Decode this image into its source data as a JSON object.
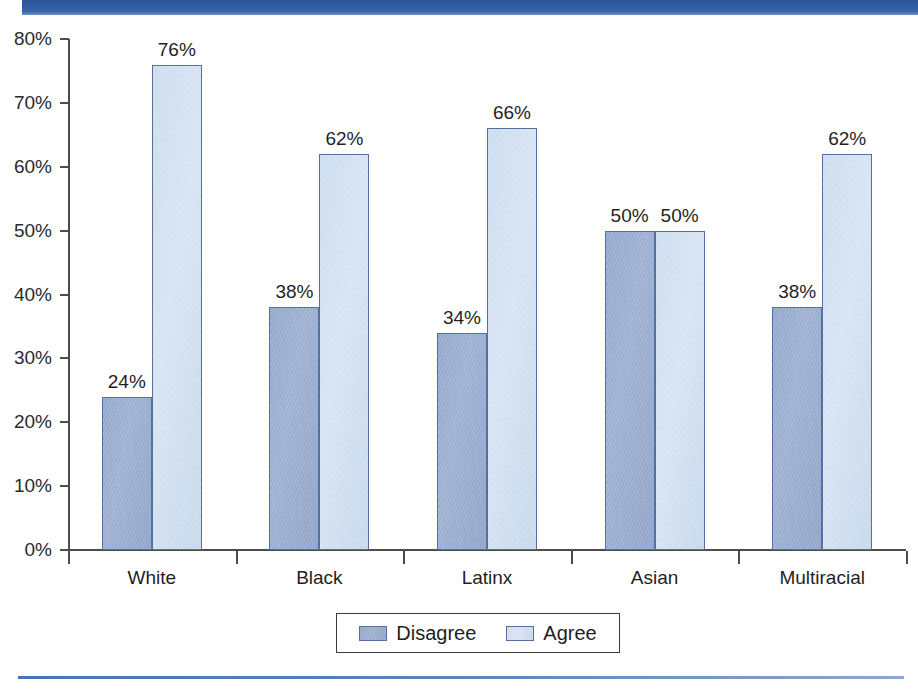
{
  "chart_data": {
    "type": "bar",
    "title": "",
    "xlabel": "",
    "ylabel": "",
    "categories": [
      "White",
      "Black",
      "Latinx",
      "Asian",
      "Multiracial"
    ],
    "series": [
      {
        "name": "Disagree",
        "color": "#93a9cc",
        "values": [
          24,
          38,
          34,
          50,
          38
        ],
        "labels": [
          "24%",
          "38%",
          "34%",
          "50%",
          "38%"
        ]
      },
      {
        "name": "Agree",
        "color": "#ccdcee",
        "values": [
          76,
          62,
          66,
          50,
          62
        ],
        "labels": [
          "76%",
          "62%",
          "66%",
          "50%",
          "62%"
        ]
      }
    ],
    "ylim": [
      0,
      80
    ],
    "ytick_values": [
      80,
      70,
      60,
      50,
      40,
      30,
      20,
      10,
      0
    ],
    "ytick_labels": [
      "80%",
      "70%",
      "60%",
      "50%",
      "40%",
      "30%",
      "20%",
      "10%",
      "0%"
    ],
    "grid": false,
    "legend_position": "bottom",
    "value_labels_shown": true
  },
  "decor": {
    "header_bar_color": "#2d5596",
    "footer_rule_color": "#4a73b4",
    "axis_color": "#4c4c4c",
    "bar_border_color": "#55719e"
  }
}
